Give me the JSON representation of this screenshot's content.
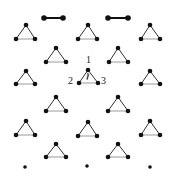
{
  "figure": {
    "colors": {
      "node": "#111111",
      "edge_dark": "#333333",
      "edge_light": "#9a9a9a"
    },
    "labels": {
      "site1": "1",
      "site2": "2",
      "site3": "3",
      "interior": "I"
    },
    "dimers": [
      {
        "x1": 44,
        "y1": 18,
        "x2": 63,
        "y2": 18
      },
      {
        "x1": 108,
        "y1": 18,
        "x2": 128,
        "y2": 18
      }
    ],
    "triangles": [
      {
        "ax": 26,
        "ay": 25,
        "bl": 16,
        "br": 35,
        "by": 39
      },
      {
        "ax": 88,
        "ay": 25,
        "bl": 78,
        "br": 97,
        "by": 39
      },
      {
        "ax": 150,
        "ay": 25,
        "bl": 141,
        "br": 160,
        "by": 39
      },
      {
        "ax": 56,
        "ay": 48,
        "bl": 46,
        "br": 66,
        "by": 62
      },
      {
        "ax": 118,
        "ay": 48,
        "bl": 109,
        "br": 128,
        "by": 62
      },
      {
        "ax": 26,
        "ay": 71,
        "bl": 16,
        "br": 35,
        "by": 84
      },
      {
        "ax": 88,
        "ay": 70,
        "bl": 79,
        "br": 98,
        "by": 83
      },
      {
        "ax": 150,
        "ay": 71,
        "bl": 141,
        "br": 160,
        "by": 84
      },
      {
        "ax": 56,
        "ay": 97,
        "bl": 46,
        "br": 66,
        "by": 111
      },
      {
        "ax": 118,
        "ay": 97,
        "bl": 108,
        "br": 128,
        "by": 111
      },
      {
        "ax": 26,
        "ay": 121,
        "bl": 16,
        "br": 35,
        "by": 135
      },
      {
        "ax": 88,
        "ay": 122,
        "bl": 78,
        "br": 97,
        "by": 136
      },
      {
        "ax": 150,
        "ay": 121,
        "bl": 141,
        "br": 160,
        "by": 135
      },
      {
        "ax": 56,
        "ay": 144,
        "bl": 46,
        "br": 66,
        "by": 157
      },
      {
        "ax": 118,
        "ay": 144,
        "bl": 108,
        "br": 128,
        "by": 157
      }
    ],
    "monomers": [
      {
        "x": 25,
        "y": 167
      },
      {
        "x": 87,
        "y": 166
      },
      {
        "x": 150,
        "y": 167
      }
    ]
  }
}
